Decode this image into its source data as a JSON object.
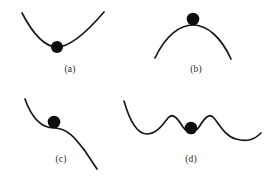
{
  "figure": {
    "background_color": "#ffffff",
    "curve_color": "#1a1a1a",
    "ball_color": "#0d0d0d",
    "label_color": "#2b2b2b",
    "panel_count": 4
  },
  "panels": [
    {
      "id": "a",
      "label": "(a)",
      "label_x": 70,
      "label_y": 70,
      "meaning": "stable equilibrium",
      "curve_kind": "concave-up parabola (valley)",
      "ball_x": 57,
      "ball_y": 47,
      "ball_r": 6,
      "path": "M 22,13 C 33,34 44,47 57,47 C 70,47 86,33 104,12"
    },
    {
      "id": "b",
      "label": "(b)",
      "label_x": 196,
      "label_y": 70,
      "meaning": "unstable equilibrium",
      "curve_kind": "concave-down parabola (hill)",
      "ball_x": 193,
      "ball_y": 19,
      "ball_r": 6.3,
      "path": "M 155,58 C 166,35 180,25 193,25 C 207,25 221,37 231,59"
    },
    {
      "id": "c",
      "label": "(c)",
      "label_x": 61,
      "label_y": 160,
      "meaning": "neutral / saddle (inflection) equilibrium",
      "curve_kind": "descending S-curve with flat inflection",
      "ball_x": 54,
      "ball_y": 122,
      "ball_r": 6.3,
      "path": "M 25,99 C 31,116 40,128 54,128 C 68,128 76,139 85,151 L 97,169"
    },
    {
      "id": "d",
      "label": "(d)",
      "label_x": 191,
      "label_y": 160,
      "meaning": "metastable equilibrium (shallow local well between two wells)",
      "curve_kind": "double-well wavy curve with central shallow dip",
      "ball_x": 191,
      "ball_y": 128,
      "ball_r": 6.3,
      "path": "M 124,101 C 130,122 137,134 147,134 C 157,134 163,124 168,118 C 173,112 178,119 183,127 C 187,133 195,133 199,127 C 204,119 209,112 214,118 C 219,124 225,136 236,139 C 247,142 254,140 261,133"
    }
  ],
  "labels": {
    "a": "(a)",
    "b": "(b)",
    "c": "(c)",
    "d": "(d)"
  }
}
